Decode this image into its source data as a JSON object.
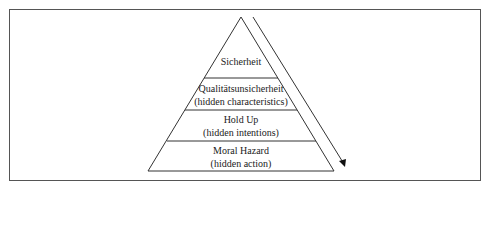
{
  "diagram": {
    "type": "pyramid",
    "levels": [
      {
        "title": "Sicherheit",
        "subtitle": ""
      },
      {
        "title": "Qualitätsunsicherheit",
        "subtitle": "(hidden characteristics)"
      },
      {
        "title": "Hold Up",
        "subtitle": "(hidden intentions)"
      },
      {
        "title": "Moral Hazard",
        "subtitle": "(hidden action)"
      }
    ],
    "arrow": {
      "direction": "down-right",
      "meaning": "increasing uncertainty"
    },
    "colors": {
      "line": "#333333",
      "text": "#222222",
      "background": "#ffffff"
    }
  }
}
